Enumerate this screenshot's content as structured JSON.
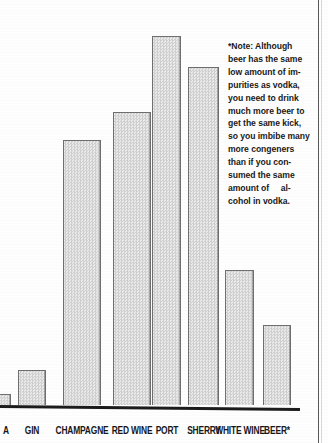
{
  "chart_data": {
    "type": "bar",
    "title": "",
    "xlabel": "",
    "ylabel": "",
    "grid": false,
    "legend": null,
    "note_marker": "*",
    "categories": [
      "VODKA",
      "GIN",
      "CHAMPAGNE",
      "RED WINE",
      "PORT",
      "SHERRY",
      "WHITE WINE",
      "BEER*"
    ],
    "tick_labels": [
      "A",
      "GIN",
      "CHAMPAGNE",
      "RED WINE",
      "PORT",
      "SHERRY",
      "WHITE WINE",
      "BEER*"
    ],
    "values": [
      4,
      11,
      72,
      80,
      100,
      92,
      37,
      23
    ],
    "ylim": [
      0,
      105
    ],
    "bars": [
      {
        "label": "A",
        "full_label": "VODKA",
        "value": 4,
        "x": 0,
        "width": 11,
        "top": 394,
        "clipped_left": true
      },
      {
        "label": "GIN",
        "full_label": "GIN",
        "value": 11,
        "x": 18,
        "width": 28,
        "top": 370,
        "clipped_left": false
      },
      {
        "label": "CHAMPAGNE",
        "full_label": "CHAMPAGNE",
        "value": 72,
        "x": 63,
        "width": 38,
        "top": 140,
        "clipped_left": false
      },
      {
        "label": "RED WINE",
        "full_label": "RED WINE",
        "value": 80,
        "x": 113,
        "width": 38,
        "top": 112,
        "clipped_left": false
      },
      {
        "label": "PORT",
        "full_label": "PORT",
        "value": 100,
        "x": 152,
        "width": 29,
        "top": 36,
        "clipped_left": false
      },
      {
        "label": "SHERRY",
        "full_label": "SHERRY",
        "value": 92,
        "x": 188,
        "width": 31,
        "top": 67,
        "clipped_left": false
      },
      {
        "label": "WHITE WINE",
        "full_label": "WHITE WINE",
        "value": 37,
        "x": 225,
        "width": 29,
        "top": 270,
        "clipped_left": false
      },
      {
        "label": "BEER*",
        "full_label": "BEER*",
        "value": 23,
        "x": 263,
        "width": 28,
        "top": 325,
        "clipped_left": false
      }
    ]
  },
  "note": {
    "lines": [
      "*Note: Although",
      "beer has the same",
      "low amount of im-",
      "purities as vodka,",
      "you need to drink",
      "much more beer to",
      "get the same kick,",
      "so you imbibe many",
      "more congeners",
      "than if you con-",
      "sumed the same",
      "amount of     al-",
      "cohol in vodka."
    ],
    "text": "*Note: Although beer has the same low amount of impurities as vodka, you need to drink much more beer to get the same kick, so you imbibe many more congeners than if you consumed the same amount of alcohol in vodka."
  },
  "colors": {
    "bar_fill": "#dcdcdc",
    "bar_outline": "#6f6f6f",
    "axis": "#1c1c1c",
    "text": "#171717",
    "page_background": "#fefefe",
    "page_border": "#3a3a3a"
  }
}
